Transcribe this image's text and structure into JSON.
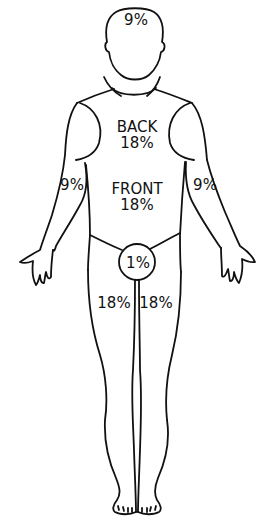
{
  "diagram": {
    "type": "rule-of-nines-body-chart",
    "regions": {
      "head": {
        "label": "9%"
      },
      "torso_back": {
        "name": "BACK",
        "label": "18%"
      },
      "torso_front": {
        "name": "FRONT",
        "label": "18%"
      },
      "left_arm": {
        "label": "9%"
      },
      "right_arm": {
        "label": "9%"
      },
      "genital": {
        "label": "1%"
      },
      "left_leg": {
        "label": "18%"
      },
      "right_leg": {
        "label": "18%"
      }
    },
    "colors": {
      "line": "#111111",
      "background": "#ffffff"
    }
  }
}
